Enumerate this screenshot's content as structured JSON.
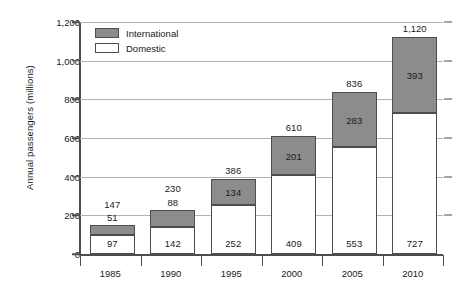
{
  "chart_data": {
    "type": "bar",
    "subtype": "stacked-vertical",
    "title": "",
    "xlabel": "",
    "ylabel": "Annual passengers (millions)",
    "categories": [
      "1985",
      "1990",
      "1995",
      "2000",
      "2005",
      "2010"
    ],
    "ylim": [
      0,
      1200
    ],
    "yticks": [
      0,
      200,
      400,
      600,
      800,
      1000,
      1200
    ],
    "ytick_labels": [
      "0",
      "200",
      "400",
      "600",
      "800",
      "1,000",
      "1,200"
    ],
    "grid": true,
    "legend_position": "top-left-inside",
    "series": [
      {
        "name": "Domestic",
        "color": "#ffffff",
        "values": [
          97,
          142,
          252,
          409,
          553,
          727
        ],
        "labels": [
          "97",
          "142",
          "252",
          "409",
          "553",
          "727"
        ]
      },
      {
        "name": "International",
        "color": "#8c8c8c",
        "values": [
          51,
          88,
          134,
          201,
          283,
          393
        ],
        "labels": [
          "51",
          "88",
          "134",
          "201",
          "283",
          "393"
        ]
      }
    ],
    "totals": [
      147,
      230,
      386,
      610,
      836,
      1120
    ],
    "total_labels": [
      "147",
      "230",
      "386",
      "610",
      "836",
      "1,120"
    ],
    "intl_label_placement": [
      "above",
      "above",
      "inside",
      "inside",
      "inside",
      "inside"
    ]
  },
  "legend": {
    "items": [
      {
        "label": "International",
        "swatch": "international"
      },
      {
        "label": "Domestic",
        "swatch": "domestic"
      }
    ]
  }
}
